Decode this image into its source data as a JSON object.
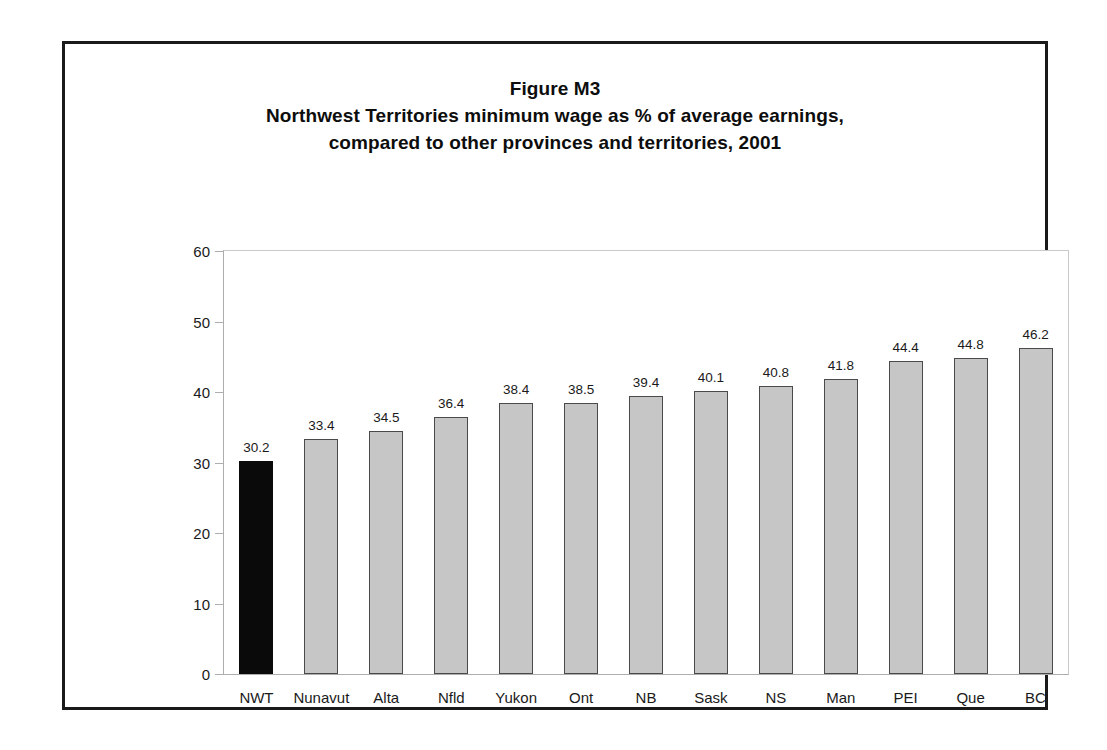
{
  "figure": {
    "title_lines": [
      "Figure M3",
      "Northwest Territories minimum wage as % of average earnings,",
      "compared to other provinces and territories, 2001"
    ]
  },
  "colors": {
    "bar_fill": "#c6c6c6",
    "bar_border": "#4a4a4a",
    "highlight_fill": "#0a0a0a",
    "axis": "#adadad",
    "frame": "#1a1a1a",
    "text": "#1a1a1a",
    "background": "#ffffff"
  },
  "chart_data": {
    "type": "bar",
    "xlabel": "",
    "ylabel": "",
    "ylim": [
      0,
      60
    ],
    "yticks": [
      0,
      10,
      20,
      30,
      40,
      50,
      60
    ],
    "grid": false,
    "legend": "none",
    "highlight_category": "NWT",
    "categories": [
      "NWT",
      "Nunavut",
      "Alta",
      "Nfld",
      "Yukon",
      "Ont",
      "NB",
      "Sask",
      "NS",
      "Man",
      "PEI",
      "Que",
      "BC"
    ],
    "values": [
      30.2,
      33.4,
      34.5,
      36.4,
      38.4,
      38.5,
      39.4,
      40.1,
      40.8,
      41.8,
      44.4,
      44.8,
      46.2
    ],
    "value_labels": [
      "30.2",
      "33.4",
      "34.5",
      "36.4",
      "38.4",
      "38.5",
      "39.4",
      "40.1",
      "40.8",
      "41.8",
      "44.4",
      "44.8",
      "46.2"
    ],
    "ytick_labels": [
      "0",
      "10",
      "20",
      "30",
      "40",
      "50",
      "60"
    ]
  }
}
